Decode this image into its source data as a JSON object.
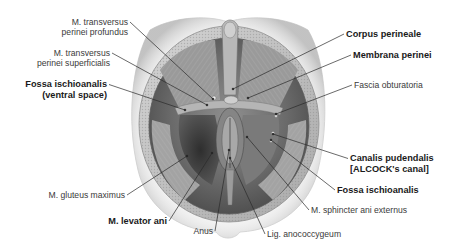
{
  "figure": {
    "type": "anatomical-illustration",
    "colors": {
      "background": "#ffffff",
      "text_regular": "#3a3a3a",
      "text_bold": "#1a1a1a",
      "leader_line": "#2a2a2a",
      "skin_shadow": "#cfcfcf",
      "fat_border": "#bdbdbd",
      "muscle_light": "#a9a9a9",
      "muscle_dark": "#3c3c3c"
    }
  },
  "labels": {
    "left": [
      {
        "id": "transversus-profundus",
        "lines": [
          "M. transversus",
          "perinei profundus"
        ],
        "bold": false,
        "x": 128,
        "y": 27,
        "align": "right",
        "target": [
          213,
          99
        ]
      },
      {
        "id": "transversus-superficialis",
        "lines": [
          "M. transversus",
          "perinei superficialis"
        ],
        "bold": false,
        "x": 110,
        "y": 58,
        "align": "right",
        "target": [
          207,
          105
        ]
      },
      {
        "id": "fossa-ischioanalis-ventral",
        "lines": [
          "Fossa ischioanalis",
          "(ventral space)"
        ],
        "bold": true,
        "x": 107,
        "y": 90,
        "align": "right",
        "target": [
          185,
          110
        ]
      },
      {
        "id": "gluteus-maximus",
        "lines": [
          "M. gluteus maximus"
        ],
        "bold": false,
        "x": 125,
        "y": 195,
        "align": "right",
        "target": [
          187,
          156
        ]
      },
      {
        "id": "levator-ani",
        "lines": [
          "M. levator ani"
        ],
        "bold": true,
        "x": 167,
        "y": 221,
        "align": "right",
        "target": [
          212,
          153
        ]
      },
      {
        "id": "anus",
        "lines": [
          "Anus"
        ],
        "bold": false,
        "x": 213,
        "y": 231,
        "align": "right",
        "target": [
          229,
          150
        ]
      }
    ],
    "right": [
      {
        "id": "corpus-perineale",
        "lines": [
          "Corpus perineale"
        ],
        "bold": true,
        "x": 346,
        "y": 34,
        "align": "left",
        "target": [
          233,
          89
        ]
      },
      {
        "id": "membrana-perinei",
        "lines": [
          "Membrana perinei"
        ],
        "bold": true,
        "x": 353,
        "y": 55,
        "align": "left",
        "target": [
          248,
          98
        ]
      },
      {
        "id": "fascia-obturatoria",
        "lines": [
          "Fascia obturatoria"
        ],
        "bold": false,
        "x": 354,
        "y": 85,
        "align": "left",
        "target": [
          276,
          114
        ]
      },
      {
        "id": "canalis-pudendalis",
        "lines": [
          "Canalis pudendalis",
          "[ALCOCK's canal]"
        ],
        "bold": true,
        "x": 350,
        "y": 164,
        "align": "left",
        "target": [
          273,
          134
        ]
      },
      {
        "id": "fossa-ischioanalis",
        "lines": [
          "Fossa ischioanalis"
        ],
        "bold": true,
        "x": 337,
        "y": 190,
        "align": "left",
        "target": [
          271,
          140
        ]
      },
      {
        "id": "sphincter-ani-externus",
        "lines": [
          "M. sphincter ani externus"
        ],
        "bold": false,
        "x": 311,
        "y": 210,
        "align": "left",
        "target": [
          247,
          137
        ]
      },
      {
        "id": "lig-anococcygeum",
        "lines": [
          "Lig. anococcygeum"
        ],
        "bold": false,
        "x": 267,
        "y": 234,
        "align": "left",
        "target": [
          230,
          158
        ]
      }
    ]
  }
}
